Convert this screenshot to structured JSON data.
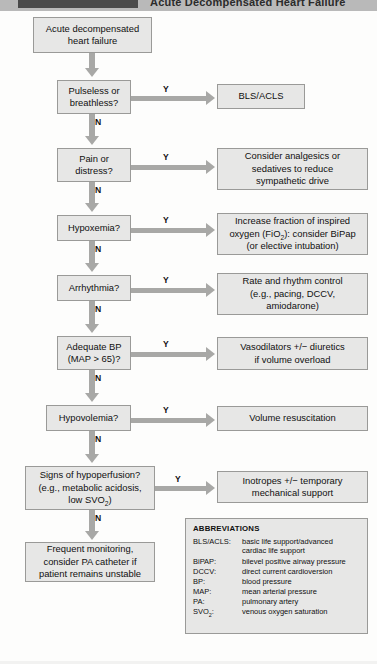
{
  "header": {
    "title": "Acute Decompensated Heart Failure"
  },
  "flow": {
    "start": "Acute decompensated\nheart failure",
    "branch_yes": "Y",
    "branch_no": "N",
    "decisions": [
      {
        "text": "Pulseless or\nbreathless?",
        "action": "BLS/ACLS"
      },
      {
        "text": "Pain or\ndistress?",
        "action": "Consider analgesics or\nsedatives to reduce\nsympathetic drive"
      },
      {
        "text": "Hypoxemia?",
        "action": "Increase fraction of inspired\noxygen (FiO2): consider BiPap\n(or elective intubation)"
      },
      {
        "text": "Arrhythmia?",
        "action": "Rate and rhythm control\n(e.g., pacing, DCCV,\namiodarone)"
      },
      {
        "text": "Adequate BP\n(MAP > 65)?",
        "action": "Vasodilators +/− diuretics\nif volume overload"
      },
      {
        "text": "Hypovolemia?",
        "action": "Volume resuscitation"
      },
      {
        "text": "Signs of hypoperfusion?\n(e.g., metabolic acidosis,\nlow SVO2)",
        "action": "Inotropes +/− temporary\nmechanical support"
      }
    ],
    "terminal": "Frequent monitoring,\nconsider PA catheter if\npatient remains unstable"
  },
  "abbreviations": {
    "title": "ABBREVIATIONS",
    "items": [
      {
        "key": "BLS/ACLS:",
        "value": "basic life support/advanced\ncardiac life support"
      },
      {
        "key": "BiPAP:",
        "value": "bilevel positive airway pressure"
      },
      {
        "key": "DCCV:",
        "value": "direct current cardioversion"
      },
      {
        "key": "BP:",
        "value": "blood pressure"
      },
      {
        "key": "MAP:",
        "value": "mean arterial pressure"
      },
      {
        "key": "PA:",
        "value": "pulmonary artery"
      },
      {
        "key": "SVO2:",
        "value": "venous oxygen saturation"
      }
    ]
  },
  "colors": {
    "box_fill": "#e7e7e6",
    "box_border": "#9a9a98",
    "connector": "#a8a8a6",
    "header_bar": "#b9b9b9"
  }
}
